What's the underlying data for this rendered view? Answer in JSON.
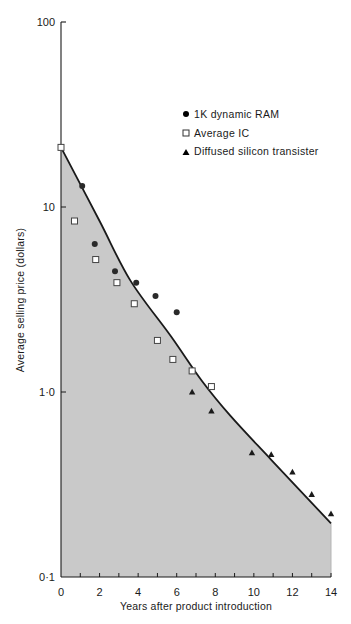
{
  "chart_data": {
    "type": "scatter",
    "title": "",
    "xlabel": "Years after product introduction",
    "ylabel": "Average selling price (dollars)",
    "xlim": [
      0,
      14
    ],
    "ylim": [
      0.1,
      100
    ],
    "yscale": "log",
    "x_ticks": [
      "0",
      "2",
      "4",
      "6",
      "8",
      "10",
      "12",
      "14"
    ],
    "y_ticks": [
      "0·1",
      "1·0",
      "10",
      "100"
    ],
    "grid": false,
    "legend_position": "upper right",
    "series": [
      {
        "name": "1K dynamic RAM",
        "marker": "filled-circle",
        "points": [
          [
            1.1,
            13
          ],
          [
            1.75,
            6.3
          ],
          [
            2.8,
            4.5
          ],
          [
            3.9,
            3.9
          ],
          [
            4.9,
            3.3
          ],
          [
            6.0,
            2.7
          ]
        ]
      },
      {
        "name": "Average IC",
        "marker": "open-square",
        "points": [
          [
            0,
            21
          ],
          [
            0.7,
            8.4
          ],
          [
            1.8,
            5.2
          ],
          [
            2.9,
            3.9
          ],
          [
            3.8,
            3.0
          ],
          [
            5.0,
            1.9
          ],
          [
            5.8,
            1.5
          ],
          [
            6.8,
            1.3
          ],
          [
            7.8,
            1.07
          ]
        ]
      },
      {
        "name": "Diffused silicon transister",
        "marker": "filled-triangle",
        "points": [
          [
            6.8,
            1.0
          ],
          [
            7.8,
            0.79
          ],
          [
            9.9,
            0.47
          ],
          [
            10.9,
            0.46
          ],
          [
            12.0,
            0.37
          ],
          [
            13.0,
            0.28
          ],
          [
            14.0,
            0.22
          ]
        ]
      },
      {
        "name": "Trend curve (shaded below)",
        "type": "line",
        "points": [
          [
            0,
            21
          ],
          [
            2,
            8.4
          ],
          [
            3.6,
            4.0
          ],
          [
            5.7,
            2.0
          ],
          [
            7.3,
            1.15
          ],
          [
            8.8,
            0.74
          ],
          [
            10.9,
            0.43
          ],
          [
            14,
            0.195
          ]
        ]
      }
    ]
  },
  "legend": {
    "items": [
      {
        "label": "1K dynamic RAM",
        "marker": "filled-circle"
      },
      {
        "label": "Average IC",
        "marker": "open-square"
      },
      {
        "label": "Diffused silicon transister",
        "marker": "filled-triangle"
      }
    ]
  },
  "axes": {
    "x_title": "Years after product introduction",
    "y_title": "Average selling price (dollars)"
  },
  "colors": {
    "shade": "#c9c9c9",
    "ink": "#1a1a1a"
  }
}
